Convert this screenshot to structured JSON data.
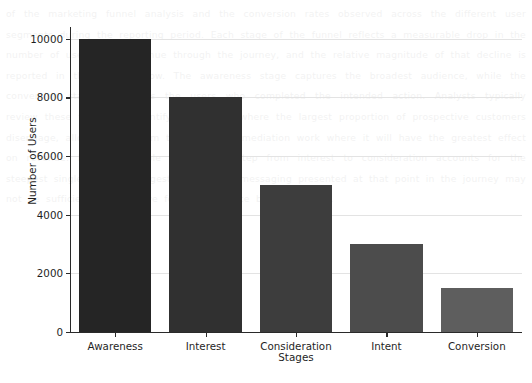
{
  "chart_data": {
    "type": "bar",
    "title": "",
    "xlabel": "Stages",
    "ylabel": "Number of Users",
    "categories": [
      "Awareness",
      "Interest",
      "Consideration",
      "Intent",
      "Conversion"
    ],
    "values": [
      10000,
      8000,
      5000,
      3000,
      1500
    ],
    "bar_colors": [
      "#252525",
      "#303030",
      "#3d3d3d",
      "#4c4c4c",
      "#5e5e5e"
    ],
    "ylim": [
      0,
      10400
    ],
    "ytick_labels": [
      "0",
      "2000",
      "4000",
      "6000",
      "8000",
      "10000"
    ],
    "ytick_values": [
      0,
      2000,
      4000,
      6000,
      8000,
      10000
    ],
    "grid": true,
    "grid_axis": "y",
    "grid_color": "#e3e3e3",
    "legend": false,
    "legend_position": "none",
    "bar_width_ratio": 0.8,
    "background_color": "#ffffff",
    "axis_color": "#2a2a2a",
    "text_color": "#1f1f1f"
  },
  "watermark": {
    "text": "of the marketing funnel analysis and the conversion rates observed across the different user segments during the reporting period. Each stage of the funnel reflects a measurable drop in the number of users who continue through the journey, and the relative magnitude of that decline is reported in the figure below. The awareness stage captures the broadest audience, while the conversion stage represents the users who completed the intended action. Analysts typically review these figures to identify the stages where the largest proportion of prospective customers disengage, allowing the team to prioritise remediation work where it will have the greatest effect on revenue. In the example shown, the step from interest to consideration accounts for the steepest single decline, suggesting that the messaging presented at that point in the journey may not be sufficiently persuasive for the audience being targeted."
  }
}
